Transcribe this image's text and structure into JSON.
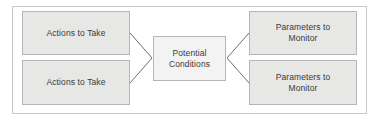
{
  "diagram": {
    "type": "flow-diagram",
    "frame": {
      "border_color": "#c9c9c9",
      "background": "#ffffff"
    },
    "colors": {
      "side_box_fill": "#e7e7e5",
      "center_box_fill": "#f3f3f3",
      "box_border": "#b6b6b6",
      "connector": "#6f6f6f",
      "text": "#3a3a3a"
    },
    "nodes": {
      "action_1": {
        "line1": "Actions to Take"
      },
      "action_2": {
        "line1": "Actions to Take"
      },
      "center": {
        "line1": "Potential",
        "line2": "Conditions"
      },
      "param_1": {
        "line1": "Parameters to",
        "line2": "Monitor"
      },
      "param_2": {
        "line1": "Parameters to",
        "line2": "Monitor"
      }
    },
    "connectors": [
      {
        "from": "action_1",
        "to": "center"
      },
      {
        "from": "action_2",
        "to": "center"
      },
      {
        "from": "center",
        "to": "param_1"
      },
      {
        "from": "center",
        "to": "param_2"
      }
    ]
  }
}
